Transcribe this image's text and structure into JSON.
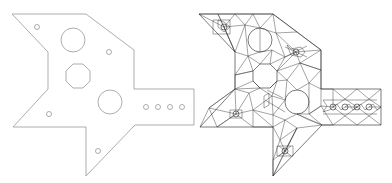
{
  "figure": {
    "panels": [
      {
        "name": "plate-outline",
        "description": "Plate geometry with holes"
      },
      {
        "name": "plate-mesh",
        "description": "Triangulated mesh of plate"
      }
    ],
    "colors": {
      "outline": "#8a8a8a",
      "mesh": "#333333",
      "background": "#ffffff"
    },
    "small_hole_row_count": 4
  }
}
